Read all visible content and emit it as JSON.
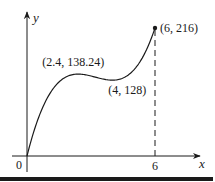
{
  "chart_data": {
    "type": "line",
    "title": "",
    "xlabel": "x",
    "ylabel": "y",
    "function": "y = 5x^3 - 48x^2 + 144x",
    "xlim": [
      0,
      6
    ],
    "ylim": [
      0,
      216
    ],
    "origin_label": "0",
    "x_ticks": [
      {
        "value": 6,
        "label": "6"
      }
    ],
    "points": [
      {
        "x": 2.4,
        "y": 138.24,
        "label": "(2.4, 138.24)",
        "kind": "local-max"
      },
      {
        "x": 4,
        "y": 128,
        "label": "(4, 128)",
        "kind": "local-min"
      },
      {
        "x": 6,
        "y": 216,
        "label": "(6, 216)",
        "kind": "endpoint"
      }
    ],
    "guides": [
      {
        "type": "dashed-vertical",
        "x": 6,
        "from_y": 0,
        "to_y": 216
      }
    ],
    "grid": false,
    "colors": {
      "ink": "#1a1a1a"
    }
  }
}
